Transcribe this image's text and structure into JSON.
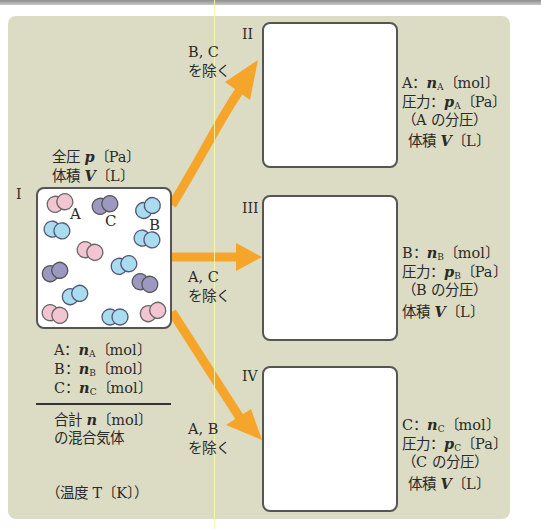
{
  "colors": {
    "panel": "#dcdcc4",
    "arrow": "#f5a52a",
    "A": "#f3c5d3",
    "B": "#a9dcef",
    "C": "#9c98c2",
    "box_border": "#555555"
  },
  "initial": {
    "label": "I",
    "header_line1": "全圧 p〔Pa〕",
    "header_line2": "体積 V〔L〕",
    "species_labels": {
      "A": "A",
      "B": "B",
      "C": "C"
    },
    "amounts": [
      "A：nA〔mol〕",
      "B：nB〔mol〕",
      "C：nC〔mol〕"
    ],
    "total_line1": "合計 n〔mol〕",
    "total_line2": "の混合気体",
    "temperature": "（温度 T〔K〕）"
  },
  "arrows": [
    {
      "line1": "B, C",
      "line2": "を除く"
    },
    {
      "line1": "A, C",
      "line2": "を除く"
    },
    {
      "line1": "A, B",
      "line2": "を除く"
    }
  ],
  "results": [
    {
      "label": "II",
      "lines": [
        "A：nA〔mol〕",
        "圧力：pA〔Pa〕",
        "（A の分圧）",
        "体積 V〔L〕"
      ]
    },
    {
      "label": "III",
      "lines": [
        "B：nB〔mol〕",
        "圧力：pB〔Pa〕",
        "（B の分圧）",
        "体積 V〔L〕"
      ]
    },
    {
      "label": "IV",
      "lines": [
        "C：nC〔mol〕",
        "圧力：pC〔Pa〕",
        "（C の分圧）",
        "体積 V〔L〕"
      ]
    }
  ]
}
